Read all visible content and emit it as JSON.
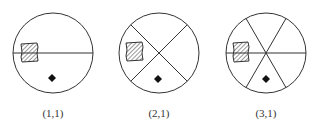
{
  "diagram": {
    "panels": [
      {
        "label": "(1,1)",
        "cx": 53,
        "cy": 53,
        "r": 40,
        "divisions": 1,
        "line_angles_deg": [
          0
        ]
      },
      {
        "label": "(2,1)",
        "cx": 159,
        "cy": 53,
        "r": 40,
        "divisions": 2,
        "line_angles_deg": [
          45,
          135
        ]
      },
      {
        "label": "(3,1)",
        "cx": 266,
        "cy": 53,
        "r": 40,
        "divisions": 3,
        "line_angles_deg": [
          0,
          60,
          120
        ]
      }
    ],
    "symbols": {
      "hatched_square": "hatched-square",
      "diamond": "filled-diamond"
    },
    "colors": {
      "stroke": "#333333",
      "fill": "#111111",
      "background": "#ffffff"
    }
  }
}
